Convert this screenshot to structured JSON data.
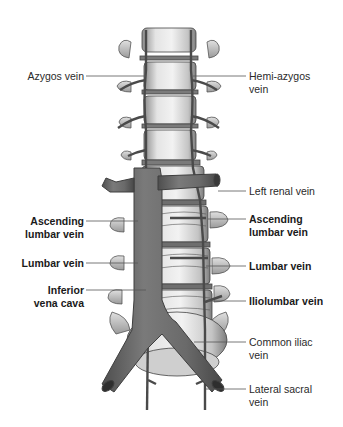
{
  "figure": {
    "colors": {
      "vein": "#6e6e6e",
      "vein_dark": "#4a4a4a",
      "vertebra": "#d8d8d8",
      "vertebra_shadow": "#9a9a9a",
      "leader_line": "#555555",
      "text": "#2a2a2a"
    },
    "labels_left": [
      {
        "id": "azygos",
        "lines": [
          "Azygos vein"
        ],
        "bold": false
      },
      {
        "id": "ascending-lumbar-left",
        "lines": [
          "Ascending",
          "lumbar vein"
        ],
        "bold": true
      },
      {
        "id": "lumbar-left",
        "lines": [
          "Lumbar vein"
        ],
        "bold": true
      },
      {
        "id": "ivc",
        "lines": [
          "Inferior",
          "vena cava"
        ],
        "bold": true
      }
    ],
    "labels_right": [
      {
        "id": "hemi-azygos",
        "lines": [
          "Hemi-azygos",
          "vein"
        ],
        "bold": false
      },
      {
        "id": "left-renal",
        "lines": [
          "Left renal vein"
        ],
        "bold": false
      },
      {
        "id": "ascending-lumbar-right",
        "lines": [
          "Ascending",
          "lumbar vein"
        ],
        "bold": true
      },
      {
        "id": "lumbar-right",
        "lines": [
          "Lumbar vein"
        ],
        "bold": true
      },
      {
        "id": "iliolumbar",
        "lines": [
          "Iliolumbar vein"
        ],
        "bold": true
      },
      {
        "id": "common-iliac",
        "lines": [
          "Common iliac",
          "vein"
        ],
        "bold": false
      },
      {
        "id": "lateral-sacral",
        "lines": [
          "Lateral sacral",
          "vein"
        ],
        "bold": false
      }
    ]
  }
}
